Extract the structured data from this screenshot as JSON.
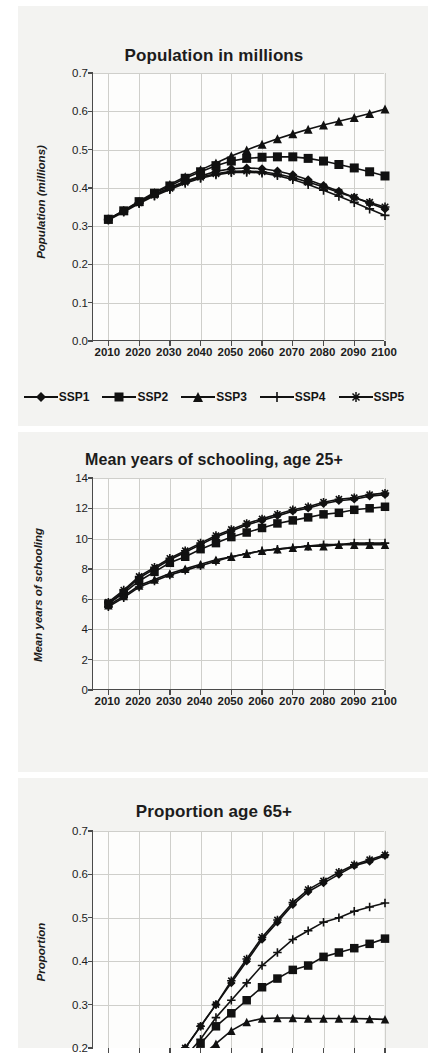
{
  "page": {
    "background": "#ffffff",
    "paper_tint": "#f3f3f1",
    "ink": "#111111",
    "grid_color": "#cfcfcb"
  },
  "legend": {
    "items": [
      {
        "label": "SSP1",
        "marker": "diamond"
      },
      {
        "label": "SSP2",
        "marker": "square"
      },
      {
        "label": "SSP3",
        "marker": "triangle"
      },
      {
        "label": "SSP4",
        "marker": "plus"
      },
      {
        "label": "SSP5",
        "marker": "asterisk"
      }
    ]
  },
  "chart_data": [
    {
      "id": "population",
      "type": "line",
      "title": "Population in millions",
      "xlabel": "",
      "ylabel": "Population (millions)",
      "x": [
        2010,
        2015,
        2020,
        2025,
        2030,
        2035,
        2040,
        2045,
        2050,
        2055,
        2060,
        2065,
        2070,
        2075,
        2080,
        2085,
        2090,
        2095,
        2100
      ],
      "xlim": [
        2005,
        2100
      ],
      "ylim": [
        0.0,
        0.7
      ],
      "yticks": [
        "0.0",
        "0.1",
        "0.2",
        "0.3",
        "0.4",
        "0.5",
        "0.6",
        "0.7"
      ],
      "xticks": [
        "2010",
        "2020",
        "2030",
        "2040",
        "2050",
        "2060",
        "2070",
        "2080",
        "2090",
        "2100"
      ],
      "grid": true,
      "legend_position": "below",
      "series": [
        {
          "name": "SSP1",
          "marker": "diamond",
          "values": [
            0.318,
            0.34,
            0.362,
            0.383,
            0.4,
            0.417,
            0.431,
            0.443,
            0.45,
            0.452,
            0.45,
            0.444,
            0.434,
            0.421,
            0.406,
            0.391,
            0.375,
            0.36,
            0.345
          ]
        },
        {
          "name": "SSP2",
          "marker": "square",
          "values": [
            0.318,
            0.34,
            0.364,
            0.386,
            0.405,
            0.425,
            0.442,
            0.458,
            0.47,
            0.477,
            0.48,
            0.481,
            0.481,
            0.477,
            0.47,
            0.461,
            0.452,
            0.442,
            0.431
          ]
        },
        {
          "name": "SSP3",
          "marker": "triangle",
          "values": [
            0.318,
            0.341,
            0.365,
            0.388,
            0.409,
            0.429,
            0.447,
            0.465,
            0.483,
            0.499,
            0.514,
            0.528,
            0.541,
            0.553,
            0.564,
            0.574,
            0.584,
            0.594,
            0.606
          ]
        },
        {
          "name": "SSP4",
          "marker": "plus",
          "values": [
            0.316,
            0.337,
            0.359,
            0.379,
            0.396,
            0.412,
            0.425,
            0.434,
            0.44,
            0.441,
            0.439,
            0.432,
            0.422,
            0.409,
            0.394,
            0.378,
            0.362,
            0.345,
            0.328
          ]
        },
        {
          "name": "SSP5",
          "marker": "asterisk",
          "values": [
            0.318,
            0.339,
            0.361,
            0.381,
            0.399,
            0.415,
            0.428,
            0.437,
            0.443,
            0.444,
            0.442,
            0.436,
            0.427,
            0.415,
            0.402,
            0.388,
            0.375,
            0.362,
            0.35
          ]
        }
      ]
    },
    {
      "id": "schooling",
      "type": "line",
      "title": "Mean years of schooling, age 25+",
      "xlabel": "",
      "ylabel": "Mean years of schooling",
      "x": [
        2010,
        2015,
        2020,
        2025,
        2030,
        2035,
        2040,
        2045,
        2050,
        2055,
        2060,
        2065,
        2070,
        2075,
        2080,
        2085,
        2090,
        2095,
        2100
      ],
      "xlim": [
        2005,
        2100
      ],
      "ylim": [
        0,
        14
      ],
      "yticks": [
        "0",
        "2",
        "4",
        "6",
        "8",
        "10",
        "12",
        "14"
      ],
      "xticks": [
        "2010",
        "2020",
        "2030",
        "2040",
        "2050",
        "2060",
        "2070",
        "2080",
        "2090",
        "2100"
      ],
      "grid": true,
      "legend_position": "none",
      "series": [
        {
          "name": "SSP1",
          "marker": "diamond",
          "values": [
            5.7,
            6.5,
            7.4,
            8.0,
            8.6,
            9.1,
            9.6,
            10.1,
            10.5,
            10.9,
            11.2,
            11.5,
            11.8,
            12.0,
            12.3,
            12.5,
            12.6,
            12.8,
            12.9
          ]
        },
        {
          "name": "SSP2",
          "marker": "square",
          "values": [
            5.7,
            6.4,
            7.2,
            7.8,
            8.4,
            8.8,
            9.3,
            9.7,
            10.1,
            10.4,
            10.7,
            11.0,
            11.2,
            11.4,
            11.6,
            11.7,
            11.9,
            12.0,
            12.1
          ]
        },
        {
          "name": "SSP3",
          "marker": "triangle",
          "values": [
            5.6,
            6.2,
            6.9,
            7.3,
            7.7,
            8.0,
            8.3,
            8.6,
            8.8,
            9.0,
            9.2,
            9.3,
            9.4,
            9.5,
            9.5,
            9.6,
            9.6,
            9.6,
            9.6
          ]
        },
        {
          "name": "SSP4",
          "marker": "plus",
          "values": [
            5.5,
            6.1,
            6.8,
            7.2,
            7.6,
            7.9,
            8.2,
            8.5,
            8.8,
            9.0,
            9.2,
            9.3,
            9.4,
            9.5,
            9.6,
            9.6,
            9.7,
            9.7,
            9.7
          ]
        },
        {
          "name": "SSP5",
          "marker": "asterisk",
          "values": [
            5.8,
            6.6,
            7.5,
            8.1,
            8.7,
            9.2,
            9.7,
            10.2,
            10.6,
            11.0,
            11.3,
            11.6,
            11.9,
            12.1,
            12.4,
            12.6,
            12.7,
            12.9,
            13.0
          ]
        }
      ]
    },
    {
      "id": "proportion65",
      "type": "line",
      "title": "Proportion age 65+",
      "xlabel": "",
      "ylabel": "Proportion",
      "x": [
        2010,
        2015,
        2020,
        2025,
        2030,
        2035,
        2040,
        2045,
        2050,
        2055,
        2060,
        2065,
        2070,
        2075,
        2080,
        2085,
        2090,
        2095,
        2100
      ],
      "xlim": [
        2005,
        2100
      ],
      "ylim": [
        0.2,
        0.7
      ],
      "ylim_note": "axis continues below 0.2 but is cropped by the page edge",
      "yticks": [
        "0.2",
        "0.3",
        "0.4",
        "0.5",
        "0.6",
        "0.7"
      ],
      "xticks": [],
      "grid": true,
      "legend_position": "none",
      "cropped_bottom": true,
      "series": [
        {
          "name": "SSP1",
          "marker": "diamond",
          "values": [
            0.08,
            0.09,
            0.11,
            0.13,
            0.16,
            0.2,
            0.25,
            0.3,
            0.35,
            0.4,
            0.45,
            0.49,
            0.53,
            0.56,
            0.58,
            0.6,
            0.62,
            0.63,
            0.643
          ]
        },
        {
          "name": "SSP2",
          "marker": "square",
          "values": [
            0.08,
            0.09,
            0.1,
            0.12,
            0.14,
            0.17,
            0.21,
            0.25,
            0.28,
            0.31,
            0.34,
            0.36,
            0.38,
            0.39,
            0.41,
            0.42,
            0.43,
            0.44,
            0.452
          ]
        },
        {
          "name": "SSP3",
          "marker": "triangle",
          "values": [
            0.08,
            0.09,
            0.1,
            0.11,
            0.13,
            0.15,
            0.18,
            0.21,
            0.24,
            0.26,
            0.268,
            0.269,
            0.269,
            0.268,
            0.268,
            0.268,
            0.268,
            0.267,
            0.266
          ]
        },
        {
          "name": "SSP4",
          "marker": "plus",
          "values": [
            0.08,
            0.09,
            0.1,
            0.12,
            0.15,
            0.18,
            0.22,
            0.27,
            0.31,
            0.35,
            0.39,
            0.42,
            0.45,
            0.47,
            0.49,
            0.5,
            0.515,
            0.525,
            0.534
          ]
        },
        {
          "name": "SSP5",
          "marker": "asterisk",
          "values": [
            0.08,
            0.09,
            0.11,
            0.13,
            0.16,
            0.2,
            0.25,
            0.3,
            0.355,
            0.405,
            0.455,
            0.495,
            0.535,
            0.565,
            0.585,
            0.605,
            0.622,
            0.634,
            0.645
          ]
        }
      ]
    }
  ]
}
